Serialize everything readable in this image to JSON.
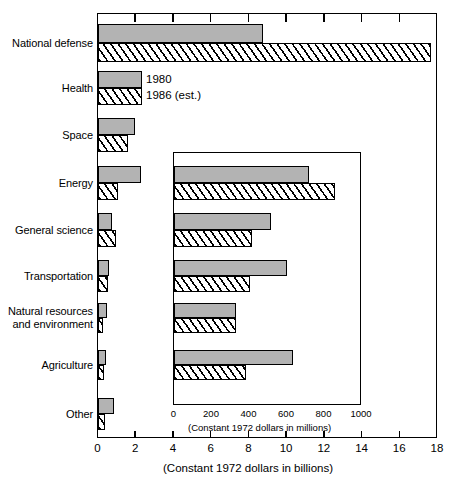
{
  "chart_data": {
    "type": "bar",
    "orientation": "horizontal",
    "title": "",
    "xlabel": "(Constant 1972 dollars in billions)",
    "ylabel": "",
    "xlim": [
      0,
      18
    ],
    "xticks": [
      0,
      2,
      4,
      6,
      8,
      10,
      12,
      14,
      16,
      18
    ],
    "grid": false,
    "legend": {
      "position": "inside-top-left",
      "entries": [
        "1980",
        "1986 (est.)"
      ]
    },
    "categories": [
      "National defense",
      "Health",
      "Space",
      "Energy",
      "General science",
      "Transportation",
      "Natural resources\nand environment",
      "Agriculture",
      "Other"
    ],
    "series": [
      {
        "name": "1980",
        "fill": "solid-gray",
        "values": [
          8.8,
          2.35,
          2.0,
          2.3,
          0.75,
          0.6,
          0.5,
          0.45,
          0.85
        ]
      },
      {
        "name": "1986 (est.)",
        "fill": "diagonal-hatch",
        "values": [
          17.7,
          2.35,
          1.6,
          1.1,
          1.0,
          0.55,
          0.3,
          0.35,
          0.4
        ]
      }
    ],
    "inset": {
      "type": "bar",
      "orientation": "horizontal",
      "xlabel": "(Constant 1972 dollars in millions)",
      "xlim": [
        0,
        1000
      ],
      "xticks": [
        0,
        200,
        400,
        600,
        800,
        1000
      ],
      "grid": false,
      "categories": [
        "Energy",
        "General science",
        "Transportation",
        "Natural resources and environment",
        "Agriculture"
      ],
      "series": [
        {
          "name": "1980",
          "fill": "solid-gray",
          "values": [
            720,
            520,
            605,
            335,
            635
          ]
        },
        {
          "name": "1986 (est.)",
          "fill": "diagonal-hatch",
          "values": [
            860,
            420,
            410,
            335,
            385
          ]
        }
      ]
    },
    "colors": {
      "series_1980": "#b3b3b3",
      "series_1986": "#ffffff",
      "outline": "#000000",
      "background": "#ffffff"
    }
  }
}
